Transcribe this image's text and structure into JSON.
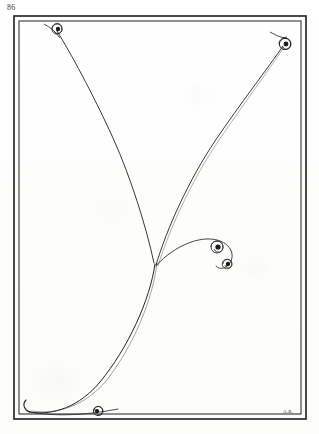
{
  "page": {
    "folio_number": "86",
    "signature": "A.B.",
    "background_color": "#fefefe",
    "ink_color": "#232323",
    "width": 319,
    "height": 434
  },
  "frame": {
    "name": "double-rule-border",
    "outer": {
      "x": 14,
      "y": 16,
      "width": 292,
      "height": 403
    },
    "inner": {
      "x": 19,
      "y": 21,
      "width": 282,
      "height": 393
    },
    "stroke_color": "#2b2b2b",
    "outer_stroke_width": 1.6,
    "inner_stroke_width": 1.1
  },
  "ornaments": {
    "corner_spirals": [
      {
        "name": "spiral-top-left",
        "cx": 57,
        "cy": 29,
        "radius": 5.2,
        "dot_radius": 2.2
      },
      {
        "name": "spiral-top-right",
        "cx": 286,
        "cy": 43,
        "radius": 5.6,
        "dot_radius": 2.4
      },
      {
        "name": "spiral-bottom-left",
        "cx": 98,
        "cy": 412,
        "radius": 4.6,
        "dot_radius": 2.1
      }
    ],
    "center_scroll_spirals": [
      {
        "name": "spiral-center-upper",
        "cx": 217,
        "cy": 247,
        "radius": 6.0,
        "dot_radius": 2.6
      },
      {
        "name": "spiral-center-lower",
        "cx": 227,
        "cy": 264,
        "radius": 4.8,
        "dot_radius": 2.2
      }
    ]
  },
  "strokes": {
    "convergence_point": {
      "x": 156,
      "y": 266
    },
    "description": "Two long sweeping pen curves descend from the upper corners and meet near the lower centre, continuing into a bottom-left sweep; a separate ornamental scroll curls to the right of the junction.",
    "stroke_color": "#232323",
    "hairline_width": 0.85,
    "paths": [
      {
        "name": "sweep-upper-left",
        "d": "M 56 29 C 84 74, 120 150, 150 232 C 153 243, 155 256, 156 266"
      },
      {
        "name": "sweep-upper-right",
        "d": "M 285 44 C 262 72, 224 117, 196 164 C 176 198, 163 238, 156 266"
      },
      {
        "name": "sweep-lower-left",
        "d": "M 156 266 C 150 300, 126 350, 94 388 C 76 408, 52 416, 28 413"
      },
      {
        "name": "sweep-lower-left-companion",
        "d": "M 157 264 C 152 298, 130 348, 100 386 C 82 406, 56 415, 30 412"
      },
      {
        "name": "sweep-baseline-tail",
        "d": "M 28 413 C 56 416, 90 414, 122 409"
      },
      {
        "name": "scroll-center-arc",
        "d": "M 157 266 C 170 254, 188 242, 206 240 C 224 238, 237 248, 233 260"
      },
      {
        "name": "scroll-center-return",
        "d": "M 233 260 C 230 269, 222 270, 220 264"
      }
    ]
  },
  "labels": {
    "folio_label": "page-number",
    "signature_label": "artist-monogram"
  }
}
